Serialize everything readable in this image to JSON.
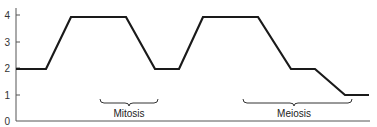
{
  "chart_data": {
    "type": "line",
    "title": "",
    "xlabel": "",
    "ylabel": "",
    "ylim": [
      0,
      4
    ],
    "yticks": [
      "0",
      "1",
      "2",
      "3",
      "4"
    ],
    "grid": false,
    "legend": null,
    "series": [
      {
        "name": "DNA content",
        "points": [
          {
            "x": 16,
            "y": 2
          },
          {
            "x": 46,
            "y": 2
          },
          {
            "x": 71,
            "y": 4
          },
          {
            "x": 126,
            "y": 4
          },
          {
            "x": 155,
            "y": 2
          },
          {
            "x": 179,
            "y": 2
          },
          {
            "x": 203,
            "y": 4
          },
          {
            "x": 258,
            "y": 4
          },
          {
            "x": 291,
            "y": 2
          },
          {
            "x": 315,
            "y": 2
          },
          {
            "x": 345,
            "y": 1
          },
          {
            "x": 369,
            "y": 1
          }
        ]
      }
    ],
    "annotations": [
      {
        "label": "Mitosis",
        "x_start": 100,
        "x_end": 158
      },
      {
        "label": "Meiosis",
        "x_start": 243,
        "x_end": 352
      }
    ]
  },
  "labels": {
    "y0": "0",
    "y1": "1",
    "y2": "2",
    "y3": "3",
    "y4": "4",
    "mitosis": "Mitosis",
    "meiosis": "Meiosis"
  },
  "colors": {
    "line": "#1a1a1a",
    "axis": "#555555"
  }
}
